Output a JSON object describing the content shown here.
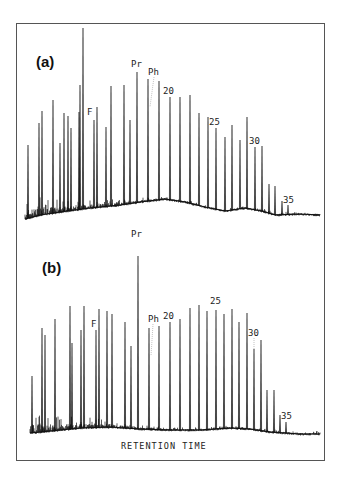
{
  "chart_data": [
    {
      "type": "line",
      "title": "(a)",
      "xlabel": "RETENTION TIME",
      "ylabel": "",
      "grid": false,
      "panel": "a",
      "annotations": [
        "F",
        "Pr",
        "Ph",
        "20",
        "25",
        "30",
        "35"
      ],
      "peaks_px": [
        [
          28,
          145
        ],
        [
          39,
          123
        ],
        [
          42,
          111
        ],
        [
          53,
          100
        ],
        [
          60,
          143
        ],
        [
          64,
          113
        ],
        [
          68,
          116
        ],
        [
          71,
          128
        ],
        [
          79,
          112
        ],
        [
          80,
          85
        ],
        [
          83,
          28
        ],
        [
          94,
          120
        ],
        [
          97,
          107
        ],
        [
          106,
          127
        ],
        [
          111,
          86
        ],
        [
          124,
          85
        ],
        [
          130,
          120
        ],
        [
          137,
          72
        ],
        [
          148,
          79
        ],
        [
          159,
          81
        ],
        [
          170,
          97
        ],
        [
          180,
          97
        ],
        [
          190,
          95
        ],
        [
          199,
          113
        ],
        [
          208,
          117
        ],
        [
          216,
          128
        ],
        [
          225,
          137
        ],
        [
          232,
          125
        ],
        [
          240,
          140
        ],
        [
          247,
          117
        ],
        [
          255,
          147
        ],
        [
          262,
          146
        ],
        [
          269,
          184
        ],
        [
          275,
          186
        ],
        [
          282,
          201
        ],
        [
          288,
          205
        ]
      ],
      "baseline_px": [
        [
          25,
          219
        ],
        [
          40,
          215
        ],
        [
          60,
          212
        ],
        [
          90,
          208
        ],
        [
          120,
          205
        ],
        [
          140,
          202
        ],
        [
          165,
          199
        ],
        [
          185,
          202
        ],
        [
          205,
          207
        ],
        [
          225,
          211
        ],
        [
          245,
          208
        ],
        [
          262,
          211
        ],
        [
          275,
          215
        ],
        [
          300,
          214
        ],
        [
          320,
          215
        ]
      ]
    },
    {
      "type": "line",
      "title": "(b)",
      "xlabel": "RETENTION TIME",
      "ylabel": "",
      "grid": false,
      "panel": "b",
      "annotations": [
        "F",
        "Pr",
        "Ph",
        "20",
        "25",
        "30",
        "35"
      ],
      "peaks_px": [
        [
          32,
          376
        ],
        [
          42,
          328
        ],
        [
          45,
          335
        ],
        [
          55,
          319
        ],
        [
          70,
          306
        ],
        [
          72,
          343
        ],
        [
          81,
          330
        ],
        [
          84,
          306
        ],
        [
          96,
          330
        ],
        [
          99,
          309
        ],
        [
          107,
          311
        ],
        [
          112,
          314
        ],
        [
          125,
          322
        ],
        [
          131,
          346
        ],
        [
          138,
          256
        ],
        [
          149,
          328
        ],
        [
          159,
          326
        ],
        [
          170,
          322
        ],
        [
          180,
          319
        ],
        [
          190,
          308
        ],
        [
          199,
          305
        ],
        [
          207,
          311
        ],
        [
          216,
          310
        ],
        [
          224,
          314
        ],
        [
          232,
          309
        ],
        [
          239,
          322
        ],
        [
          247,
          313
        ],
        [
          254,
          349
        ],
        [
          261,
          340
        ],
        [
          267,
          390
        ],
        [
          274,
          390
        ],
        [
          280,
          415
        ],
        [
          286,
          422
        ]
      ],
      "baseline_px": [
        [
          30,
          433
        ],
        [
          50,
          431
        ],
        [
          80,
          428
        ],
        [
          110,
          427
        ],
        [
          140,
          429
        ],
        [
          170,
          430
        ],
        [
          200,
          430
        ],
        [
          230,
          428
        ],
        [
          250,
          429
        ],
        [
          270,
          432
        ],
        [
          300,
          434
        ],
        [
          320,
          434
        ]
      ]
    }
  ],
  "panels": {
    "a": {
      "label": "(a)",
      "peak_labels": {
        "F": "F",
        "Pr": "Pr",
        "Ph": "Ph",
        "c20": "20",
        "c25": "25",
        "c30": "30",
        "c35": "35"
      }
    },
    "b": {
      "label": "(b)",
      "peak_labels": {
        "F": "F",
        "Pr": "Pr",
        "Ph": "Ph",
        "c20": "20",
        "c25": "25",
        "c30": "30",
        "c35": "35"
      }
    }
  },
  "x_axis_label": "RETENTION TIME",
  "colors": {
    "trace": "#111111",
    "frame": "#555555",
    "background": "#ffffff"
  }
}
